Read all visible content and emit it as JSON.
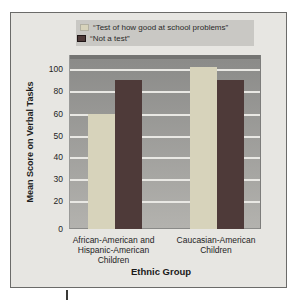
{
  "chart_data": {
    "type": "bar",
    "title": "",
    "categories": [
      [
        "African-American and",
        "Hispanic-American",
        "Children"
      ],
      [
        "Caucasian-American",
        "Children"
      ]
    ],
    "series": [
      {
        "name": "“Test of how good at school problems”",
        "values": [
          60,
          102
        ],
        "color": "#d7d3bb"
      },
      {
        "name": "“Not a test”",
        "values": [
          90,
          90
        ],
        "color": "#4e3a39"
      }
    ],
    "xlabel": "Ethnic Group",
    "ylabel": "Mean Score on Verbal Tasks",
    "yticks": [
      0,
      20,
      30,
      40,
      50,
      60,
      80,
      100
    ],
    "ylim": [
      0,
      105
    ],
    "grid": true,
    "legend_position": "top",
    "colors": {
      "panel_bg": "#e7e6e2",
      "panel_border": "#6b6b69",
      "legend_bg": "#c9c8c4",
      "plot_top": "#8a8a88",
      "plot_bottom": "#b3b2ae",
      "plot_edge": "#747472",
      "gridline": "#e9e8e4",
      "text": "#222222"
    }
  }
}
